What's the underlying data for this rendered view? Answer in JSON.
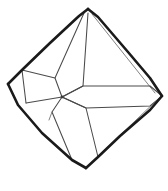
{
  "figure": {
    "style": "hand-drawn ink outline, no shading",
    "background_color": "#ffffff",
    "outer_stroke_color": "#1a1a1a",
    "inner_stroke_color": "#4a4a4a",
    "faint_stroke_color": "#6b6b6b",
    "canvas": {
      "width": 168,
      "height": 191
    },
    "labels": [],
    "vertices": {
      "top": {
        "x": 88,
        "y": 9
      },
      "right": {
        "x": 162,
        "y": 96
      },
      "bottom": {
        "x": 86,
        "y": 168
      },
      "left": {
        "x": 8,
        "y": 84
      },
      "center_node": {
        "x": 62,
        "y": 97
      },
      "upper_left_shoulder": {
        "x": 55,
        "y": 78
      },
      "upper_right_shoulder": {
        "x": 83,
        "y": 86
      },
      "lower_left_shoulder": {
        "x": 52,
        "y": 112
      },
      "lower_right_shoulder": {
        "x": 86,
        "y": 108
      },
      "left_upper_hinge": {
        "x": 22,
        "y": 70
      },
      "left_lower_hinge": {
        "x": 26,
        "y": 103
      },
      "bottom_left_hinge": {
        "x": 72,
        "y": 160
      },
      "bottom_right_hinge": {
        "x": 98,
        "y": 157
      },
      "right_upper_hinge": {
        "x": 150,
        "y": 86
      },
      "right_lower_hinge": {
        "x": 150,
        "y": 106
      },
      "top_left_hinge": {
        "x": 79,
        "y": 16
      },
      "top_right_hinge": {
        "x": 98,
        "y": 17
      }
    },
    "outline_path": "M 88 9 L 162 96 L 86 168 L 8 84 Z",
    "facets": [
      {
        "name": "upper-left-face"
      },
      {
        "name": "upper-right-face"
      },
      {
        "name": "lower-left-face"
      },
      {
        "name": "lower-right-face"
      },
      {
        "name": "central-spine-facet"
      },
      {
        "name": "left-wing-facet"
      },
      {
        "name": "right-band-facet"
      },
      {
        "name": "bottom-keel-facet"
      }
    ]
  }
}
